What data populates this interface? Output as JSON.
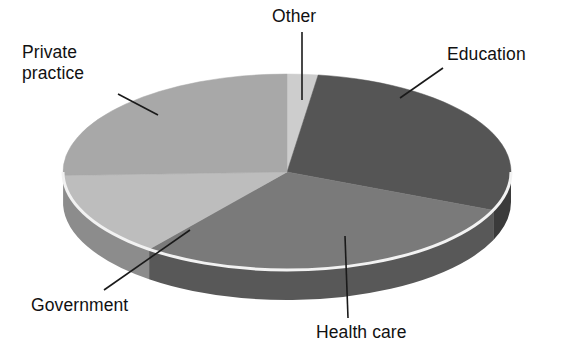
{
  "chart_data": {
    "type": "pie",
    "title": "Employment sector distribution",
    "xlabel": "",
    "ylabel": "",
    "legend_position": "none",
    "grid": false,
    "three_d": true,
    "start_angle_deg": 0,
    "direction": "clockwise",
    "categories": [
      "Other",
      "Education",
      "Health care",
      "Government",
      "Private practice"
    ],
    "values": [
      2.2,
      29.2,
      29.2,
      13.9,
      25.5
    ],
    "slices": [
      {
        "label": "Other",
        "value": 2.2,
        "start_angle_deg": 0,
        "end_angle_deg": 8,
        "color": "#cdcdcd",
        "side_color": "#9a9a9a"
      },
      {
        "label": "Education",
        "value": 29.2,
        "start_angle_deg": 8,
        "end_angle_deg": 113,
        "color": "#555555",
        "side_color": "#3b3b3b"
      },
      {
        "label": "Health care",
        "value": 29.2,
        "start_angle_deg": 113,
        "end_angle_deg": 218,
        "color": "#7a7a7a",
        "side_color": "#585858"
      },
      {
        "label": "Government",
        "value": 13.9,
        "start_angle_deg": 218,
        "end_angle_deg": 268,
        "color": "#bdbdbd",
        "side_color": "#8c8c8c"
      },
      {
        "label": "Private practice",
        "value": 25.5,
        "start_angle_deg": 268,
        "end_angle_deg": 360,
        "color": "#a8a8a8",
        "side_color": "#7e7e7e"
      }
    ],
    "labels": {
      "private_practice": "Private\npractice",
      "other": "Other",
      "education": "Education",
      "government": "Government",
      "health_care": "Health care"
    },
    "colors": {
      "background": "#ffffff",
      "text": "#111111",
      "leader_line": "#1a1a1a",
      "rim_highlight": "#f2f2f2"
    },
    "geometry": {
      "center_x": 287,
      "center_y": 172,
      "radius_x": 224,
      "radius_y": 98,
      "depth": 30
    }
  }
}
